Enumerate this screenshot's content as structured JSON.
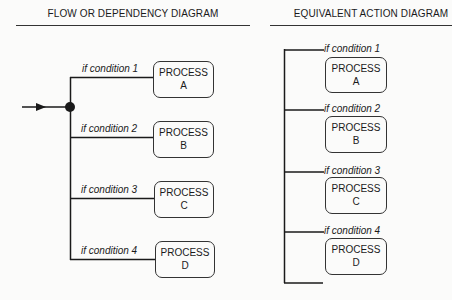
{
  "left_diagram": {
    "title": "FLOW OR DEPENDENCY DIAGRAM",
    "branches": [
      {
        "condition": "if condition 1",
        "process": "PROCESS",
        "letter": "A"
      },
      {
        "condition": "if condition 2",
        "process": "PROCESS",
        "letter": "B"
      },
      {
        "condition": "if condition 3",
        "process": "PROCESS",
        "letter": "C"
      },
      {
        "condition": "if condition 4",
        "process": "PROCESS",
        "letter": "D"
      }
    ]
  },
  "right_diagram": {
    "title": "EQUIVALENT ACTION DIAGRAM",
    "branches": [
      {
        "condition": "if condition 1",
        "process": "PROCESS",
        "letter": "A"
      },
      {
        "condition": "if condition 2",
        "process": "PROCESS",
        "letter": "B"
      },
      {
        "condition": "if condition 3",
        "process": "PROCESS",
        "letter": "C"
      },
      {
        "condition": "if condition 4",
        "process": "PROCESS",
        "letter": "D"
      }
    ]
  },
  "colors": {
    "line": "#1a1a1a",
    "background": "#fbfbfa"
  }
}
